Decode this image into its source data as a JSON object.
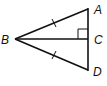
{
  "diagram": {
    "type": "geometry-triangle",
    "points": {
      "A": {
        "label": "A",
        "x": 88,
        "y": 9
      },
      "B": {
        "label": "B",
        "x": 15,
        "y": 39
      },
      "C": {
        "label": "C",
        "x": 88,
        "y": 39
      },
      "D": {
        "label": "D",
        "x": 88,
        "y": 70
      }
    },
    "segments": [
      "BA",
      "BC",
      "BD",
      "AD"
    ],
    "marks": {
      "congruent_ticks": [
        "BA",
        "BD"
      ],
      "right_angle_at": "C"
    },
    "colors": {
      "stroke": "#111111",
      "background": "#ffffff"
    }
  }
}
